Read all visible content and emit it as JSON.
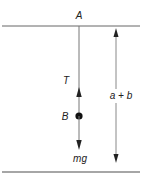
{
  "diagram": {
    "type": "free-body-diagram",
    "colors": {
      "line": "#555555",
      "arrow": "#333333",
      "mass": "#111111",
      "text": "#222222"
    },
    "labels": {
      "support_point": "A",
      "tension": "T",
      "mass": "B",
      "weight": "mg",
      "distance": "a + b"
    },
    "elements": {
      "top_line": {
        "x1": 2,
        "x2": 140,
        "y": 26
      },
      "bottom_line": {
        "x1": 2,
        "x2": 140,
        "y": 172
      },
      "string": {
        "x": 79,
        "y1": 26,
        "y2": 116
      },
      "mass_point": {
        "x": 79,
        "y": 116,
        "r": 3.5
      },
      "tension_arrow": {
        "direction": "up",
        "x": 79,
        "tip_y": 88
      },
      "weight_arrow": {
        "direction": "down",
        "x": 79,
        "tip_y": 150
      },
      "distance_arrow": {
        "direction": "both",
        "x": 116,
        "y1": 28,
        "y2": 162
      }
    }
  }
}
